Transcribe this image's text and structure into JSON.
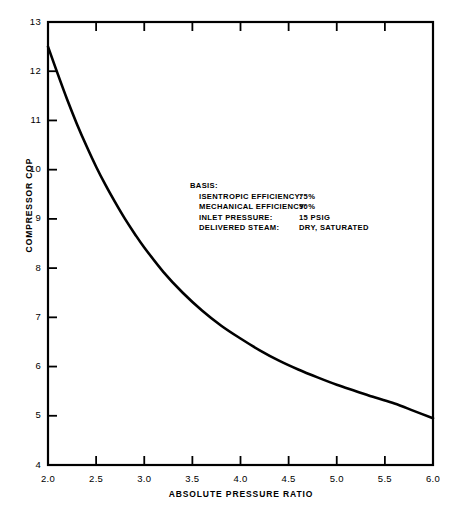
{
  "chart_data": {
    "type": "line",
    "title": "",
    "xlabel": "ABSOLUTE  PRESSURE  RATIO",
    "ylabel": "COMPRESSOR  COP",
    "xlim": [
      2.0,
      6.0
    ],
    "ylim": [
      4,
      13
    ],
    "grid": false,
    "legend": null,
    "xticks": [
      "2.0",
      "2.5",
      "3.0",
      "3.5",
      "4.0",
      "4.5",
      "5.0",
      "5.5",
      "6.0"
    ],
    "xtick_values": [
      2.0,
      2.5,
      3.0,
      3.5,
      4.0,
      4.5,
      5.0,
      5.5,
      6.0
    ],
    "yticks": [
      "4",
      "5",
      "6",
      "7",
      "8",
      "9",
      "10",
      "11",
      "12",
      "13"
    ],
    "ytick_values": [
      4,
      5,
      6,
      7,
      8,
      9,
      10,
      11,
      12,
      13
    ],
    "series": [
      {
        "name": "Compressor COP",
        "x": [
          2.0,
          2.1,
          2.2,
          2.3,
          2.4,
          2.5,
          2.6,
          2.7,
          2.8,
          2.9,
          3.0,
          3.2,
          3.4,
          3.6,
          3.8,
          4.0,
          4.2,
          4.4,
          4.6,
          4.8,
          5.0,
          5.2,
          5.4,
          5.6,
          5.8,
          6.0
        ],
        "values": [
          12.5,
          11.95,
          11.42,
          10.93,
          10.48,
          10.06,
          9.68,
          9.33,
          9.0,
          8.7,
          8.42,
          7.92,
          7.5,
          7.14,
          6.83,
          6.57,
          6.33,
          6.12,
          5.94,
          5.78,
          5.63,
          5.5,
          5.37,
          5.25,
          5.1,
          4.95
        ]
      }
    ],
    "annotations": {
      "heading": "BASIS:",
      "rows": [
        {
          "label": "ISENTROPIC EFFICIENCY:",
          "value": "75%"
        },
        {
          "label": "MECHANICAL EFFICIENCY:",
          "value": "90%"
        },
        {
          "label": "INLET PRESSURE:",
          "value": "15 PSIG"
        },
        {
          "label": "DELIVERED STEAM:",
          "value": "DRY, SATURATED"
        }
      ]
    },
    "style": {
      "line_color": "#000000",
      "axis_color": "#000000",
      "background": "#ffffff",
      "line_width": 2.6
    }
  }
}
